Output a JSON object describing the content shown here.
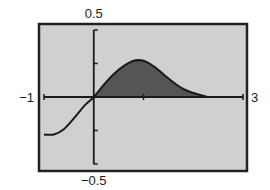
{
  "chart_data": {
    "type": "area",
    "title": "",
    "xlabel": "",
    "ylabel": "",
    "xlim": [
      -1,
      3
    ],
    "ylim": [
      -0.5,
      0.5
    ],
    "x_tick_labels": {
      "min": "-1",
      "max": "3"
    },
    "y_tick_labels": {
      "max": "0.5",
      "min": "-0.5"
    },
    "x_ticks": [
      -1,
      1,
      3
    ],
    "y_ticks": [
      -0.5,
      -0.25,
      0.25,
      0.5
    ],
    "grid": false,
    "legend": null,
    "series": [
      {
        "name": "f(x)",
        "x": [
          -1.0,
          -0.8,
          -0.6,
          -0.4,
          -0.2,
          0.0,
          0.2,
          0.4,
          0.6,
          0.8,
          1.0,
          1.2,
          1.4,
          1.6,
          1.8,
          2.0,
          2.2,
          2.3
        ],
        "y": [
          -0.28,
          -0.28,
          -0.24,
          -0.16,
          -0.07,
          0.0,
          0.09,
          0.17,
          0.23,
          0.27,
          0.27,
          0.23,
          0.17,
          0.11,
          0.06,
          0.03,
          0.01,
          0.0
        ]
      }
    ],
    "shaded_region": {
      "from_x": 0.0,
      "to_x": 2.3,
      "description": "area between curve and x-axis"
    }
  },
  "colors": {
    "screen_bg": "#d0d0d0",
    "frame": "#222222",
    "axis": "#1a1a1a",
    "curve": "#1a1a1a",
    "fill": "#555555"
  }
}
